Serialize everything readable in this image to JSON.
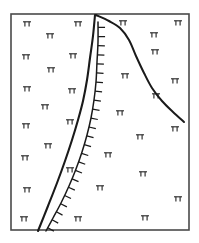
{
  "figure": {
    "background_color": "#ffffff",
    "frame": {
      "x": 11,
      "y": 14,
      "width": 178,
      "height": 216,
      "stroke_color": "#4a4a4a",
      "stroke_width": 1.6
    }
  },
  "chart_data": {
    "type": "diagram",
    "xlabel": "",
    "ylabel": "",
    "grid": false,
    "legend": "none",
    "xlim": [
      11,
      189
    ],
    "ylim": [
      14,
      230
    ],
    "line_color": "#1a1a1a",
    "symbol_color": "#2b2b2b",
    "features": [
      {
        "name": "fault-trace",
        "style": "solid-thick",
        "description": "Solid heavy line descending from top margin to bottom margin, concave toward the east",
        "points": [
          [
            95,
            15
          ],
          [
            93,
            36
          ],
          [
            90,
            58
          ],
          [
            87,
            80
          ],
          [
            83,
            101
          ],
          [
            78,
            120
          ],
          [
            72,
            140
          ],
          [
            65,
            161
          ],
          [
            57,
            183
          ],
          [
            48,
            206
          ],
          [
            38,
            231
          ]
        ]
      },
      {
        "name": "hachured-fault-trace",
        "style": "solid-with-hachures",
        "hachure_side": "east",
        "hachure_count": 24,
        "hachure_length": 7,
        "description": "Barbed or hachured line marking a thrust or normal fault, ticks directed to the east",
        "points": [
          [
            98,
            22
          ],
          [
            98,
            42
          ],
          [
            97,
            62
          ],
          [
            96,
            82
          ],
          [
            94,
            100
          ],
          [
            91,
            118
          ],
          [
            87,
            135
          ],
          [
            82,
            152
          ],
          [
            76,
            169
          ],
          [
            69,
            186
          ],
          [
            61,
            203
          ],
          [
            53,
            218
          ],
          [
            46,
            231
          ]
        ]
      },
      {
        "name": "branch-trace",
        "style": "solid-thick",
        "description": "Solid line branching east from the common apex and descending to the southeast, terminating inside the frame",
        "points": [
          [
            96,
            15
          ],
          [
            109,
            21
          ],
          [
            120,
            28
          ],
          [
            129,
            40
          ],
          [
            136,
            56
          ],
          [
            144,
            73
          ],
          [
            152,
            88
          ],
          [
            162,
            101
          ],
          [
            173,
            112
          ],
          [
            184,
            122
          ]
        ]
      }
    ],
    "symbol_legend": {
      "name": "strike-and-dip-symbol",
      "description": "Small bar-and-tick symbol indicating bedding attitude",
      "count": 41
    },
    "symbols": [
      {
        "x": 27,
        "y": 24
      },
      {
        "x": 78,
        "y": 24
      },
      {
        "x": 123,
        "y": 23
      },
      {
        "x": 178,
        "y": 23
      },
      {
        "x": 50,
        "y": 36
      },
      {
        "x": 73,
        "y": 56
      },
      {
        "x": 154,
        "y": 35
      },
      {
        "x": 26,
        "y": 57
      },
      {
        "x": 51,
        "y": 70
      },
      {
        "x": 155,
        "y": 52
      },
      {
        "x": 125,
        "y": 76
      },
      {
        "x": 27,
        "y": 89
      },
      {
        "x": 72,
        "y": 91
      },
      {
        "x": 175,
        "y": 81
      },
      {
        "x": 45,
        "y": 107
      },
      {
        "x": 156,
        "y": 96
      },
      {
        "x": 120,
        "y": 113
      },
      {
        "x": 26,
        "y": 126
      },
      {
        "x": 70,
        "y": 122
      },
      {
        "x": 175,
        "y": 129
      },
      {
        "x": 140,
        "y": 137
      },
      {
        "x": 48,
        "y": 146
      },
      {
        "x": 108,
        "y": 155
      },
      {
        "x": 25,
        "y": 158
      },
      {
        "x": 70,
        "y": 170
      },
      {
        "x": 143,
        "y": 174
      },
      {
        "x": 27,
        "y": 190
      },
      {
        "x": 100,
        "y": 188
      },
      {
        "x": 178,
        "y": 199
      },
      {
        "x": 24,
        "y": 219
      },
      {
        "x": 78,
        "y": 219
      },
      {
        "x": 145,
        "y": 218
      }
    ]
  }
}
